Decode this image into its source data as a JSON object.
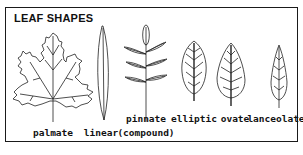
{
  "title": "LEAF SHAPES",
  "leaves": [
    {
      "id": "palmate",
      "label": "palmate",
      "sublabel": ""
    },
    {
      "id": "linear",
      "label": "linear",
      "sublabel": ""
    },
    {
      "id": "pinnate",
      "label": "pinnate",
      "sublabel": "(compound)"
    },
    {
      "id": "elliptic",
      "label": "elliptic",
      "sublabel": ""
    },
    {
      "id": "ovate",
      "label": "ovate",
      "sublabel": ""
    },
    {
      "id": "lanceolate",
      "label": "lanceolate",
      "sublabel": ""
    }
  ],
  "colors": {
    "ink": "#222222",
    "background": "#ffffff"
  }
}
